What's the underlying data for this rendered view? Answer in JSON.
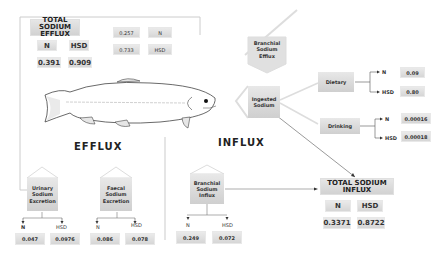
{
  "efflux": {
    "heading": "EFFLUX",
    "total": {
      "title_line1": "TOTAL SODIUM",
      "title_line2": "EFFLUX",
      "n_label": "N",
      "hsd_label": "HSD",
      "n_value": "0.391",
      "hsd_value": "0.909"
    },
    "branchial": {
      "line1": "Branchial",
      "line2": "Sodium",
      "line3": "Efflux",
      "n_label": "N",
      "hsd_label": "HSD",
      "n_value": "0.257",
      "hsd_value": "0.733"
    },
    "urinary": {
      "line1": "Urinary",
      "line2": "Sodium",
      "line3": "Excretion",
      "n_label": "N",
      "hsd_label": "HSD",
      "n_value": "0.047",
      "hsd_value": "0.0976"
    },
    "faecal": {
      "line1": "Faecal",
      "line2": "Sodium",
      "line3": "Excretion",
      "n_label": "N",
      "hsd_label": "HSD",
      "n_value": "0.086",
      "hsd_value": "0.078"
    }
  },
  "influx": {
    "heading": "INFLUX",
    "ingested": {
      "line1": "Ingested",
      "line2": "Sodium"
    },
    "dietary": {
      "label": "Dietary",
      "n_label": "N",
      "hsd_label": "HSD",
      "n_value": "0.09",
      "hsd_value": "0.80"
    },
    "drinking": {
      "label": "Drinking",
      "n_label": "N",
      "hsd_label": "HSD",
      "n_value": "0.00016",
      "hsd_value": "0.00018"
    },
    "branchial": {
      "line1": "Branchial",
      "line2": "Sodium",
      "line3": "Influx",
      "n_label": "N",
      "hsd_label": "HSD",
      "n_value": "0.249",
      "hsd_value": "0.072"
    },
    "total": {
      "title_line1": "TOTAL SODIUM",
      "title_line2": "INFLUX",
      "n_label": "N",
      "hsd_label": "HSD",
      "n_value": "0.3371",
      "hsd_value": "0.8722"
    }
  },
  "illustration": {
    "subject": "fish-trout"
  }
}
